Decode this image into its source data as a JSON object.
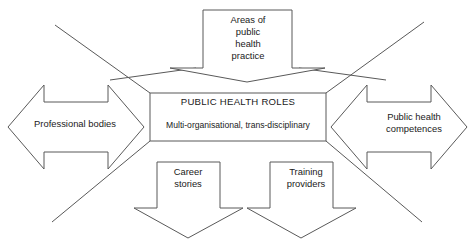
{
  "diagram": {
    "type": "starburst-block-arrow-diagram",
    "canvas": {
      "width": 475,
      "height": 240,
      "background": "#ffffff"
    },
    "stroke_color": "#595959",
    "text_color": "#1a1a1a",
    "center": {
      "title": "PUBLIC HEALTH ROLES",
      "subtitle": "Multi-organisational, trans-disciplinary"
    },
    "arrows": {
      "top": {
        "label": "Areas of\npublic\nhealth\npractice",
        "direction": "down"
      },
      "left": {
        "label": "Professional bodies",
        "direction": "left"
      },
      "right": {
        "label": "Public health\ncompetences",
        "direction": "right"
      },
      "bottom_left": {
        "label": "Career\nstories",
        "direction": "down"
      },
      "bottom_right": {
        "label": "Training\nproviders",
        "direction": "down"
      }
    }
  }
}
